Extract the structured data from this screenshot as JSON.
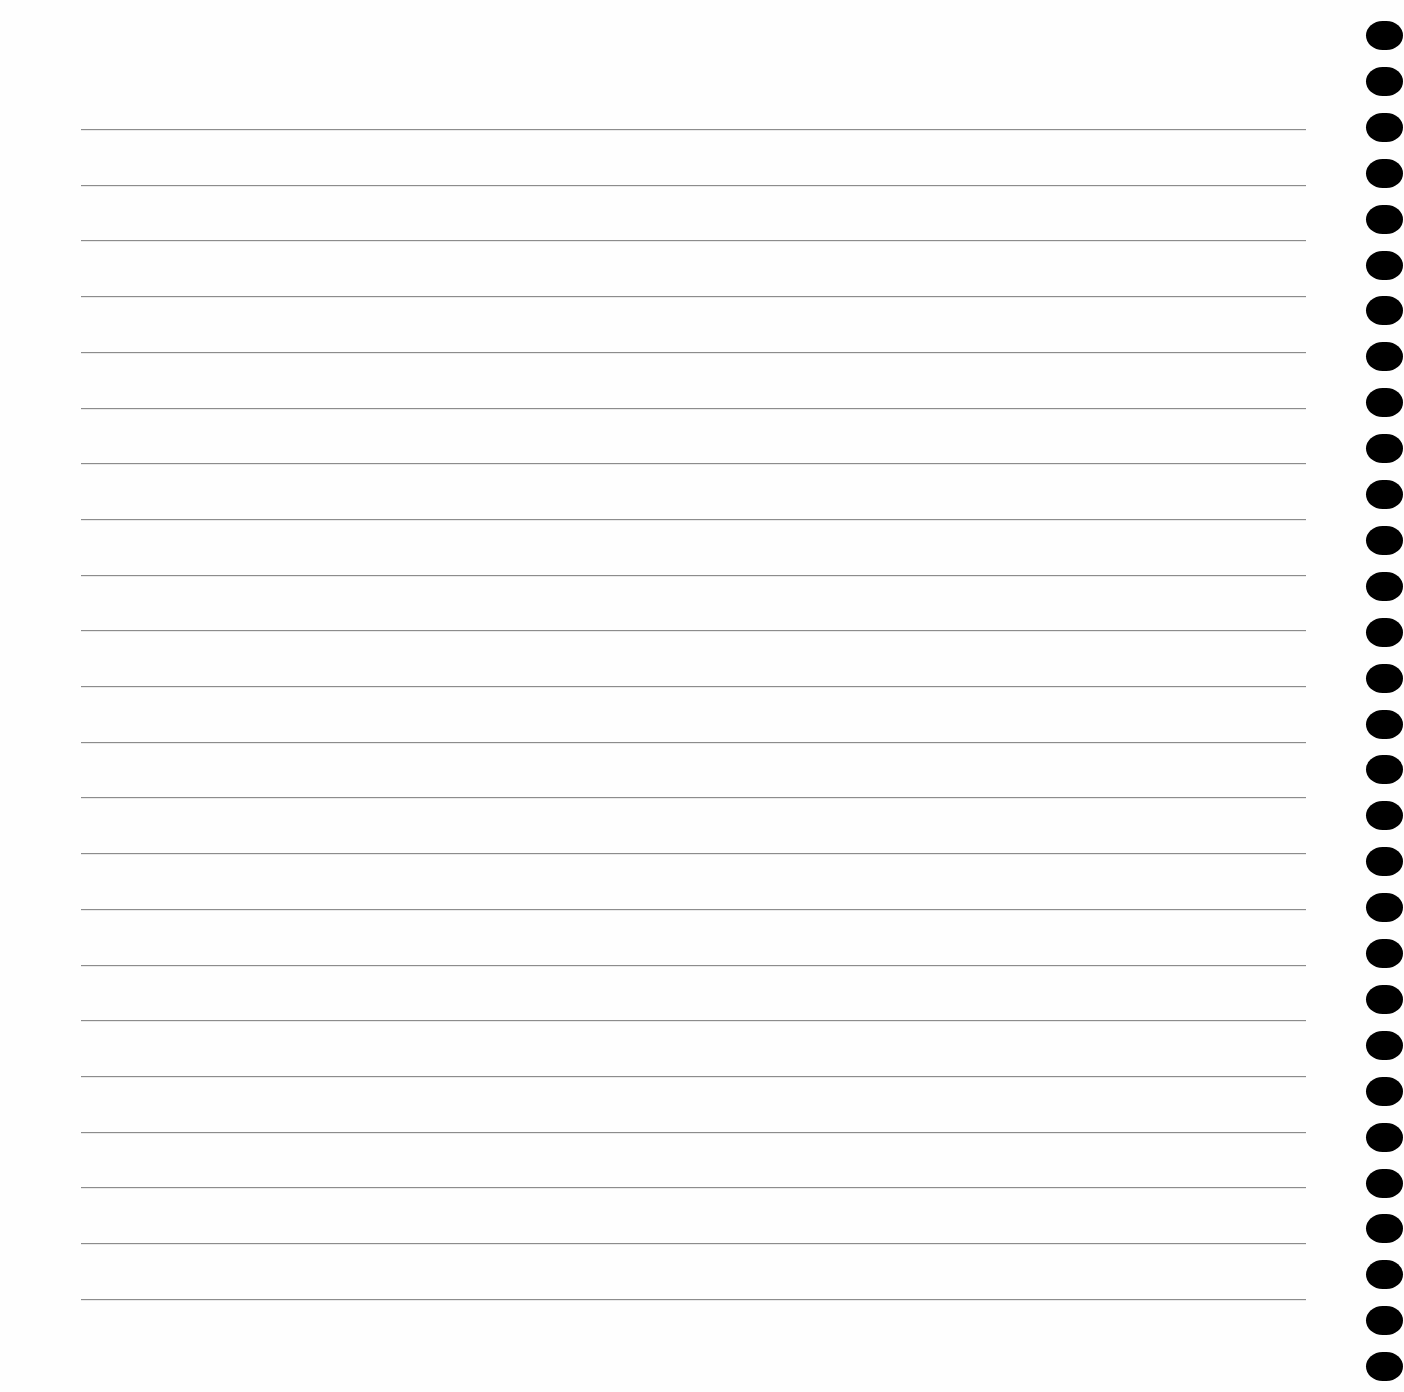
{
  "page": {
    "type": "lined-notebook-page",
    "background_color": "#fefefe",
    "rule_color": "#8c8c8c",
    "hole_color": "#000000"
  },
  "rules": {
    "count": 22,
    "first_y": 129,
    "spacing": 55.7,
    "left": 81,
    "right": 1306
  },
  "binding_holes": {
    "count": 30,
    "first_y": 21,
    "spacing": 45.9,
    "left": 1366,
    "width": 37,
    "height": 29
  }
}
